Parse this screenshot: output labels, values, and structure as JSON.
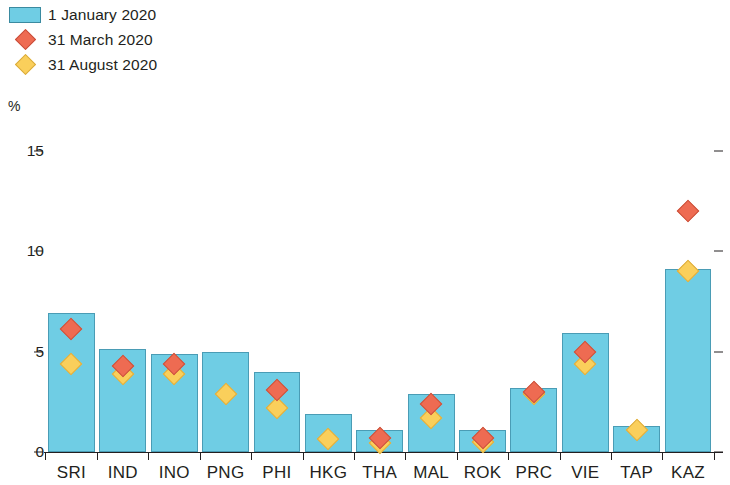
{
  "legend": {
    "items": [
      {
        "label": "1 January 2020",
        "marker": "bar-swatch",
        "color": "#6FCDE4"
      },
      {
        "label": "31 March 2020",
        "marker": "diamond-red",
        "color": "#EE6B52"
      },
      {
        "label": "31 August 2020",
        "marker": "diamond-yellow",
        "color": "#FACF5B"
      }
    ]
  },
  "axis": {
    "unit": "%",
    "yticks": [
      "0",
      "5",
      "10",
      "15"
    ]
  },
  "chart_data": {
    "type": "bar",
    "title": "",
    "xlabel": "",
    "ylabel": "%",
    "ylim": [
      0,
      15
    ],
    "ytick_values": [
      0,
      5,
      10,
      15
    ],
    "grid": false,
    "legend_position": "top-left",
    "categories": [
      "SRI",
      "IND",
      "INO",
      "PNG",
      "PHI",
      "HKG",
      "THA",
      "MAL",
      "ROK",
      "PRC",
      "VIE",
      "TAP",
      "KAZ"
    ],
    "series": [
      {
        "name": "1 January 2020",
        "type": "bar",
        "color": "#6FCDE4",
        "values": [
          6.9,
          5.1,
          4.9,
          5.0,
          4.0,
          1.9,
          1.1,
          2.9,
          1.1,
          3.2,
          5.9,
          1.3,
          9.1
        ]
      },
      {
        "name": "31 March 2020",
        "type": "scatter",
        "marker": "diamond",
        "color": "#EE6B52",
        "values": [
          6.1,
          4.3,
          4.4,
          null,
          3.1,
          null,
          0.7,
          2.4,
          0.7,
          3.0,
          5.0,
          null,
          12.0
        ]
      },
      {
        "name": "31 August 2020",
        "type": "scatter",
        "marker": "diamond",
        "color": "#FACF5B",
        "values": [
          4.4,
          3.9,
          3.9,
          2.9,
          2.2,
          0.65,
          0.45,
          1.7,
          0.5,
          2.9,
          4.4,
          1.1,
          9.0
        ]
      }
    ]
  }
}
